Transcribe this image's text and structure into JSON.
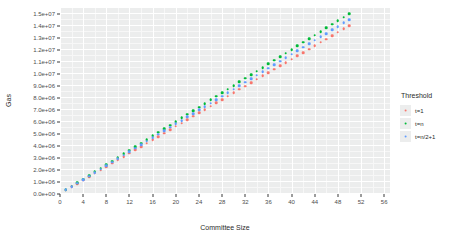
{
  "chart_data": {
    "type": "scatter",
    "title": "",
    "xlabel": "Committee Size",
    "ylabel": "Gas",
    "xlim": [
      0,
      57
    ],
    "ylim": [
      0,
      15500000
    ],
    "grid": true,
    "legend_position": "right",
    "legend_title": "Threshold",
    "x_ticks": [
      0,
      4,
      8,
      12,
      16,
      20,
      24,
      28,
      32,
      36,
      40,
      44,
      48,
      52,
      56
    ],
    "x_tick_labels": [
      "0",
      "4",
      "8",
      "12",
      "16",
      "20",
      "24",
      "28",
      "32",
      "36",
      "40",
      "44",
      "48",
      "52",
      "56"
    ],
    "y_ticks": [
      0,
      1000000,
      2000000,
      3000000,
      4000000,
      5000000,
      6000000,
      7000000,
      8000000,
      9000000,
      10000000,
      11000000,
      12000000,
      13000000,
      14000000,
      15000000
    ],
    "y_tick_labels": [
      "0.0e+00",
      "1.0e+06",
      "2.0e+06",
      "3.0e+06",
      "4.0e+06",
      "5.0e+06",
      "6.0e+06",
      "7.0e+06",
      "8.0e+06",
      "9.0e+06",
      "1.0e+07",
      "1.1e+07",
      "1.2e+07",
      "1.3e+07",
      "1.4e+07",
      "1.5e+07"
    ],
    "x": [
      1,
      2,
      3,
      4,
      5,
      6,
      7,
      8,
      9,
      10,
      11,
      12,
      13,
      14,
      15,
      16,
      17,
      18,
      19,
      20,
      21,
      22,
      23,
      24,
      25,
      26,
      27,
      28,
      29,
      30,
      31,
      32,
      33,
      34,
      35,
      36,
      37,
      38,
      39,
      40,
      41,
      42,
      43,
      44,
      45,
      46,
      47,
      48,
      49,
      50
    ],
    "series": [
      {
        "name": "t=1",
        "color": "#f8766d",
        "values": [
          310000,
          590000,
          870000,
          1150000,
          1430000,
          1710000,
          1990000,
          2270000,
          2550000,
          2830000,
          3110000,
          3390000,
          3670000,
          3950000,
          4230000,
          4510000,
          4790000,
          5070000,
          5350000,
          5630000,
          5910000,
          6190000,
          6470000,
          6750000,
          7030000,
          7310000,
          7590000,
          7870000,
          8150000,
          8430000,
          8710000,
          8990000,
          9270000,
          9550000,
          9830000,
          10110000,
          10390000,
          10670000,
          10950000,
          11230000,
          11510000,
          11790000,
          12070000,
          12350000,
          12630000,
          12910000,
          13190000,
          13470000,
          13750000,
          14030000
        ]
      },
      {
        "name": "t=n",
        "color": "#00ba38",
        "values": [
          350000,
          640000,
          940000,
          1240000,
          1540000,
          1840000,
          2140000,
          2440000,
          2740000,
          3040000,
          3340000,
          3640000,
          3940000,
          4240000,
          4540000,
          4840000,
          5140000,
          5440000,
          5740000,
          6040000,
          6340000,
          6640000,
          6940000,
          7240000,
          7540000,
          7840000,
          8140000,
          8440000,
          8740000,
          9040000,
          9340000,
          9640000,
          9940000,
          10240000,
          10540000,
          10840000,
          11140000,
          11440000,
          11740000,
          12040000,
          12340000,
          12640000,
          12940000,
          13240000,
          13540000,
          13840000,
          14140000,
          14440000,
          14740000,
          15040000
        ]
      },
      {
        "name": "t=n/2+1",
        "color": "#619cff",
        "values": [
          330000,
          615000,
          905000,
          1195000,
          1485000,
          1775000,
          2065000,
          2355000,
          2645000,
          2935000,
          3225000,
          3515000,
          3805000,
          4095000,
          4385000,
          4675000,
          4965000,
          5255000,
          5545000,
          5835000,
          6125000,
          6415000,
          6705000,
          6995000,
          7285000,
          7575000,
          7865000,
          8155000,
          8445000,
          8735000,
          9025000,
          9315000,
          9605000,
          9895000,
          10185000,
          10475000,
          10765000,
          11055000,
          11345000,
          11635000,
          11925000,
          12215000,
          12505000,
          12795000,
          13085000,
          13375000,
          13665000,
          13955000,
          14245000,
          14535000
        ]
      }
    ]
  }
}
